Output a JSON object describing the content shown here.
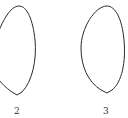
{
  "figure": {
    "shapes": [
      {
        "id": "shape-2",
        "label": "2"
      },
      {
        "id": "shape-3",
        "label": "3"
      }
    ],
    "stroke_color": "#2a2a2a",
    "background": "#ffffff"
  }
}
